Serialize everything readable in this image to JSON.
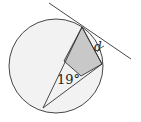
{
  "diagram": {
    "type": "circle-geometry",
    "labels": {
      "angle": "19°",
      "unknown": "d"
    },
    "colors": {
      "circle_fill": "#f2f2f2",
      "shaded_region": "#c8c8c8",
      "stroke": "#333333"
    }
  }
}
